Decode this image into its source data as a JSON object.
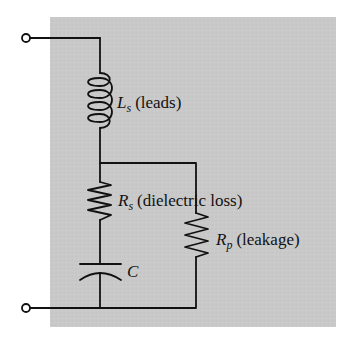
{
  "diagram": {
    "type": "circuit",
    "colors": {
      "background_panel": "#c9c9c9",
      "wire": "#111111",
      "page": "#ffffff"
    },
    "terminals": [
      {
        "id": "top-terminal"
      },
      {
        "id": "bottom-terminal"
      }
    ],
    "components": {
      "inductor": {
        "symbol": "L",
        "subscript": "s",
        "description": "(leads)"
      },
      "series_resistor": {
        "symbol": "R",
        "subscript": "s",
        "description": "(dielectric loss)"
      },
      "capacitor": {
        "symbol": "C"
      },
      "parallel_resistor": {
        "symbol": "R",
        "subscript": "p",
        "description": "(leakage)"
      }
    }
  }
}
